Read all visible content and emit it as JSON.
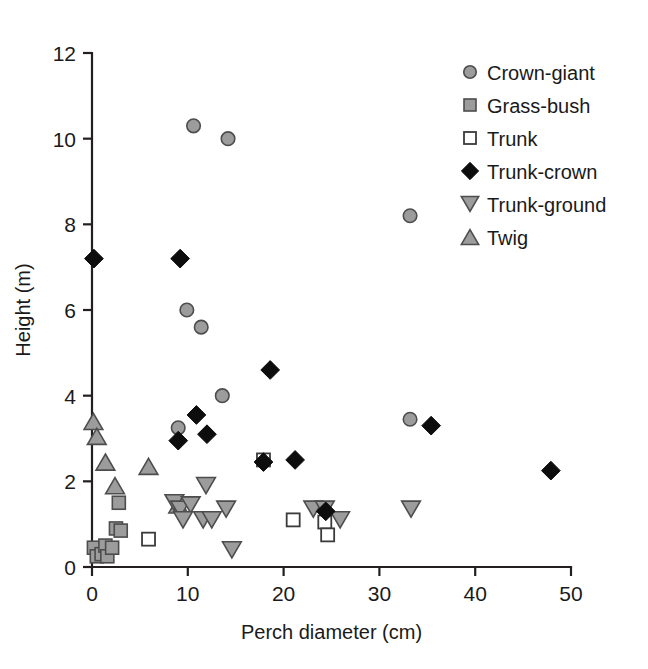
{
  "chart_data": {
    "type": "scatter",
    "title": "",
    "xlabel": "Perch diameter (cm)",
    "ylabel": "Height (m)",
    "xlim": [
      0,
      50
    ],
    "ylim": [
      0,
      12
    ],
    "xticks": [
      0,
      10,
      20,
      30,
      40,
      50
    ],
    "yticks": [
      0,
      2,
      4,
      6,
      8,
      10,
      12
    ],
    "grid": false,
    "legend_position": "top-right",
    "series": [
      {
        "name": "Crown-giant",
        "marker": "circle-filled-gray",
        "points": [
          [
            10.6,
            10.3
          ],
          [
            14.2,
            10.0
          ],
          [
            33.2,
            8.2
          ],
          [
            9.9,
            6.0
          ],
          [
            11.4,
            5.6
          ],
          [
            13.6,
            4.0
          ],
          [
            9.0,
            3.25
          ],
          [
            33.2,
            3.45
          ]
        ]
      },
      {
        "name": "Grass-bush",
        "marker": "square-filled-gray",
        "points": [
          [
            0.2,
            0.45
          ],
          [
            0.5,
            0.25
          ],
          [
            1.0,
            0.3
          ],
          [
            1.4,
            0.5
          ],
          [
            1.6,
            0.25
          ],
          [
            2.1,
            0.45
          ],
          [
            2.5,
            0.9
          ],
          [
            3.0,
            0.85
          ],
          [
            2.8,
            1.5
          ]
        ]
      },
      {
        "name": "Trunk",
        "marker": "square-open",
        "points": [
          [
            5.9,
            0.65
          ],
          [
            17.9,
            2.5
          ],
          [
            21.0,
            1.1
          ],
          [
            24.3,
            1.05
          ],
          [
            24.6,
            0.75
          ]
        ]
      },
      {
        "name": "Trunk-crown",
        "marker": "diamond-filled-black",
        "points": [
          [
            0.2,
            7.2
          ],
          [
            9.2,
            7.2
          ],
          [
            10.9,
            3.55
          ],
          [
            12.0,
            3.1
          ],
          [
            9.0,
            2.95
          ],
          [
            18.6,
            4.6
          ],
          [
            17.9,
            2.45
          ],
          [
            21.2,
            2.5
          ],
          [
            24.4,
            1.3
          ],
          [
            35.4,
            3.3
          ],
          [
            47.9,
            2.25
          ]
        ]
      },
      {
        "name": "Trunk-ground",
        "marker": "triangle-down-gray",
        "points": [
          [
            8.6,
            1.5
          ],
          [
            9.2,
            1.35
          ],
          [
            10.3,
            1.45
          ],
          [
            9.5,
            1.1
          ],
          [
            11.6,
            1.1
          ],
          [
            12.5,
            1.1
          ],
          [
            11.9,
            1.9
          ],
          [
            14.0,
            1.35
          ],
          [
            14.6,
            0.4
          ],
          [
            23.1,
            1.35
          ],
          [
            24.3,
            1.35
          ],
          [
            25.9,
            1.1
          ],
          [
            33.3,
            1.35
          ]
        ]
      },
      {
        "name": "Twig",
        "marker": "triangle-up-gray",
        "points": [
          [
            0.15,
            3.4
          ],
          [
            0.5,
            3.05
          ],
          [
            1.4,
            2.45
          ],
          [
            2.4,
            1.9
          ],
          [
            5.9,
            2.35
          ],
          [
            9.0,
            1.45
          ]
        ]
      }
    ]
  },
  "legend": {
    "items": [
      {
        "label": "Crown-giant"
      },
      {
        "label": "Grass-bush"
      },
      {
        "label": "Trunk"
      },
      {
        "label": "Trunk-crown"
      },
      {
        "label": "Trunk-ground"
      },
      {
        "label": "Twig"
      }
    ]
  },
  "axes": {
    "x_title": "Perch diameter (cm)",
    "y_title": "Height (m)",
    "x_tick_labels": [
      "0",
      "10",
      "20",
      "30",
      "40",
      "50"
    ],
    "y_tick_labels": [
      "0",
      "2",
      "4",
      "6",
      "8",
      "10",
      "12"
    ]
  },
  "colors": {
    "marker_gray_fill": "#9c9c9c",
    "marker_gray_stroke": "#4d4d4d",
    "marker_black": "#0d0d0d",
    "axis": "#231f20",
    "text": "#1a1a1a",
    "background": "#ffffff"
  }
}
